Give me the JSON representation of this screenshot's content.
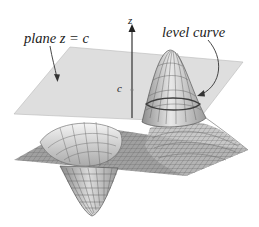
{
  "diagram": {
    "type": "3d-surface-with-level-plane",
    "labels": {
      "plane": "plane z = c",
      "level_curve": "level curve",
      "z_axis": "z",
      "c_mark": "c"
    },
    "colors": {
      "plane_fill": "#c9c9c9",
      "plane_edge": "#b0b0b0",
      "mesh_line": "#5e5e5e",
      "surface_fill": "#9a9a9a",
      "surface_light": "#e6e6e6",
      "axis": "#222222",
      "arrow": "#333333",
      "level_curve": "#444444"
    },
    "elements": [
      "translucent horizontal plane z = c",
      "wireframe surface with one peak and one trough",
      "vertical z-axis with arrowhead",
      "tick mark labeled c on z-axis",
      "level curve where the plane intersects the peak",
      "arrow from 'plane z = c' label to the plane",
      "curved arrow from 'level curve' label to the intersection curve"
    ]
  }
}
